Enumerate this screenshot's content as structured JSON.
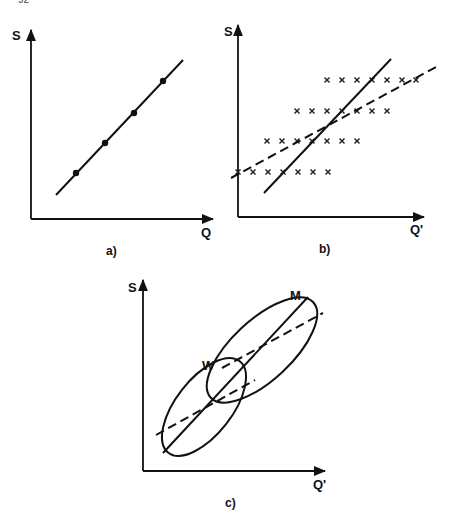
{
  "page": {
    "page_number_fragment": "92"
  },
  "panels": {
    "a": {
      "caption": "a)",
      "y_axis_label": "S",
      "x_axis_label": "Q",
      "line": {
        "style": "solid",
        "from": [
          56,
          195
        ],
        "to": [
          183,
          60
        ]
      },
      "points": [
        [
          76,
          173
        ],
        [
          105,
          143
        ],
        [
          134,
          113
        ],
        [
          163,
          81
        ]
      ]
    },
    "b": {
      "caption": "b)",
      "y_axis_label": "S",
      "x_axis_label": "Q'",
      "solid_line": {
        "from": [
          264,
          193
        ],
        "to": [
          391,
          59
        ]
      },
      "dashed_line": {
        "from": [
          231,
          178
        ],
        "to": [
          436,
          67
        ]
      },
      "marker": "x",
      "rows": [
        {
          "y": 80,
          "xs": [
            327,
            342,
            357,
            372,
            387,
            402,
            416
          ]
        },
        {
          "y": 111,
          "xs": [
            297,
            312,
            327,
            342,
            357,
            372,
            387
          ]
        },
        {
          "y": 141,
          "xs": [
            267,
            282,
            297,
            312,
            327,
            342,
            357
          ]
        },
        {
          "y": 172,
          "xs": [
            238,
            253,
            268,
            283,
            298,
            313,
            328
          ]
        }
      ]
    },
    "c": {
      "caption": "c)",
      "y_axis_label": "S",
      "x_axis_label": "Q'",
      "group_labels": {
        "upper": "M",
        "lower": "W"
      },
      "solid_line": {
        "from": [
          163,
          453
        ],
        "to": [
          308,
          297
        ]
      },
      "dashed_lines": [
        {
          "group": "M",
          "from": [
            222,
            368
          ],
          "to": [
            323,
            313
          ]
        },
        {
          "group": "W",
          "from": [
            156,
            435
          ],
          "to": [
            255,
            380
          ]
        }
      ],
      "ellipses": [
        {
          "group": "M",
          "cx": 262,
          "cy": 350,
          "rx": 70,
          "ry": 30,
          "rotate": -43
        },
        {
          "group": "W",
          "cx": 204,
          "cy": 407,
          "rx": 58,
          "ry": 28,
          "rotate": -52
        }
      ]
    }
  },
  "chart_data": [
    {
      "type": "scatter",
      "title": "a)",
      "xlabel": "Q",
      "ylabel": "S",
      "description": "Perfect linear relation between S and Q; four points lying exactly on a rising straight line",
      "series": [
        {
          "name": "observations",
          "x": [
            1,
            2,
            3,
            4
          ],
          "y": [
            1,
            2,
            3,
            4
          ]
        }
      ],
      "grid": false
    },
    {
      "type": "scatter",
      "title": "b)",
      "xlabel": "Q'",
      "ylabel": "S",
      "description": "Grid of x-marked observations in 4 rows, each row shifted right as S increases; steep solid line and shallower dashed regression line crossing at the centre",
      "series": [
        {
          "name": "observations (row S=4)",
          "x": [
            7,
            8,
            9,
            10,
            11,
            12,
            13
          ],
          "y": [
            4,
            4,
            4,
            4,
            4,
            4,
            4
          ]
        },
        {
          "name": "observations (row S=3)",
          "x": [
            5,
            6,
            7,
            8,
            9,
            10,
            11
          ],
          "y": [
            3,
            3,
            3,
            3,
            3,
            3,
            3
          ]
        },
        {
          "name": "observations (row S=2)",
          "x": [
            3,
            4,
            5,
            6,
            7,
            8,
            9
          ],
          "y": [
            2,
            2,
            2,
            2,
            2,
            2,
            2
          ]
        },
        {
          "name": "observations (row S=1)",
          "x": [
            1,
            2,
            3,
            4,
            5,
            6,
            7
          ],
          "y": [
            1,
            1,
            1,
            1,
            1,
            1,
            1
          ]
        }
      ],
      "lines": [
        "solid (steep)",
        "dashed (shallow regression)"
      ],
      "grid": false
    },
    {
      "type": "scatter",
      "title": "c)",
      "xlabel": "Q'",
      "ylabel": "S",
      "description": "Two elliptical data clouds labelled W (lower-left) and M (upper-right) along a common solid line, each with its own shallower dashed within-group regression line",
      "series": [
        {
          "name": "W",
          "shape": "ellipse"
        },
        {
          "name": "M",
          "shape": "ellipse"
        }
      ],
      "grid": false
    }
  ]
}
